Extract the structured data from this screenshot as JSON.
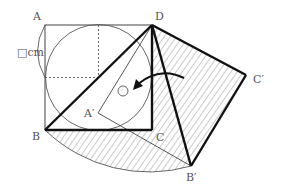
{
  "diagram": {
    "type": "geometry-rotation",
    "labels": {
      "A": "A",
      "B": "B",
      "C": "C",
      "D": "D",
      "A_prime": "A′",
      "B_prime": "B′",
      "C_prime": "C′",
      "side_length": "□cm",
      "angle_mark": "○"
    },
    "points": {
      "A": [
        45,
        25
      ],
      "B": [
        45,
        130
      ],
      "C": [
        152,
        130
      ],
      "D": [
        152,
        25
      ],
      "A_prime": [
        98,
        113
      ],
      "B_prime": [
        191,
        166
      ],
      "C_prime": [
        246,
        75
      ]
    },
    "colors": {
      "line": "#111111",
      "thin": "#555555",
      "hatch": "#777777",
      "text": "#555555"
    }
  }
}
